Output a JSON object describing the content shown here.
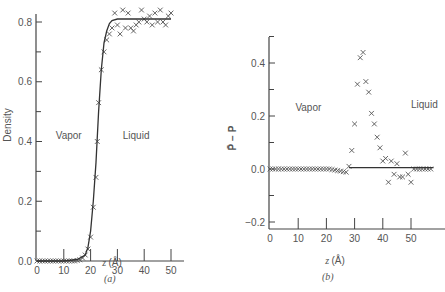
{
  "chart_data": [
    {
      "id": "a",
      "type": "scatter",
      "caption": "(a)",
      "title": "",
      "xlabel": "z (Å)",
      "ylabel": "Density",
      "xlim": [
        0,
        55
      ],
      "ylim": [
        0,
        0.84
      ],
      "xticks": [
        0,
        10,
        20,
        30,
        40,
        50
      ],
      "yticks": [
        0.0,
        0.2,
        0.4,
        0.6,
        0.8
      ],
      "ytick_labels": [
        "0.0",
        "0.2",
        "0.4",
        "0.6",
        "0.8"
      ],
      "grid": false,
      "annotations": [
        {
          "text": "Vapor",
          "x": 7,
          "y": 0.41
        },
        {
          "text": "Liquid",
          "x": 32,
          "y": 0.41
        }
      ],
      "series": [
        {
          "name": "simulation",
          "style": "markers-x",
          "x": [
            0,
            1,
            2,
            3,
            4,
            5,
            6,
            7,
            8,
            9,
            10,
            11,
            12,
            13,
            14,
            15,
            16,
            17,
            18,
            19,
            20,
            21,
            22,
            22.5,
            23,
            24,
            25,
            26,
            27,
            28,
            29,
            30,
            31,
            32,
            33,
            34,
            35,
            36,
            37,
            38,
            39,
            40,
            41,
            42,
            43,
            44,
            45,
            46,
            47,
            48,
            49,
            50
          ],
          "y": [
            0,
            0,
            0,
            0,
            0,
            0,
            0,
            0,
            0,
            0,
            0,
            0,
            0,
            0,
            0,
            0.002,
            0.004,
            0.01,
            0.02,
            0.04,
            0.08,
            0.18,
            0.28,
            0.4,
            0.53,
            0.64,
            0.7,
            0.74,
            0.76,
            0.78,
            0.83,
            0.79,
            0.76,
            0.84,
            0.78,
            0.83,
            0.78,
            0.77,
            0.79,
            0.8,
            0.84,
            0.81,
            0.8,
            0.82,
            0.79,
            0.83,
            0.8,
            0.84,
            0.8,
            0.79,
            0.82,
            0.83
          ]
        },
        {
          "name": "fit",
          "style": "line",
          "x": [
            0,
            5,
            10,
            15,
            18,
            19,
            20,
            21,
            22,
            23,
            24,
            25,
            26,
            27,
            28,
            30,
            35,
            40,
            45,
            50
          ],
          "y": [
            0,
            0,
            0,
            0.005,
            0.02,
            0.045,
            0.1,
            0.2,
            0.33,
            0.5,
            0.64,
            0.73,
            0.77,
            0.795,
            0.805,
            0.81,
            0.81,
            0.81,
            0.81,
            0.81
          ]
        }
      ]
    },
    {
      "id": "b",
      "type": "scatter",
      "caption": "(b)",
      "title": "",
      "xlabel": "z (Å)",
      "ylabel": "P̄ − P",
      "xlim": [
        0,
        58
      ],
      "ylim": [
        -0.22,
        0.5
      ],
      "xticks": [
        0,
        10,
        20,
        30,
        40,
        50
      ],
      "yticks": [
        -0.2,
        0.0,
        0.2,
        0.4
      ],
      "ytick_labels": [
        "−0.2",
        "0.0",
        "0.2",
        "0.4"
      ],
      "grid": false,
      "annotations": [
        {
          "text": "Vapor",
          "x": 9,
          "y": 0.22
        },
        {
          "text": "Liquid",
          "x": 50,
          "y": 0.23
        }
      ],
      "series": [
        {
          "name": "simulation",
          "style": "markers-x",
          "x": [
            0,
            1,
            2,
            3,
            4,
            5,
            6,
            7,
            8,
            9,
            10,
            11,
            12,
            13,
            14,
            15,
            16,
            17,
            18,
            19,
            20,
            21,
            22,
            23,
            24,
            25,
            26,
            27,
            28,
            29,
            30,
            31,
            32,
            33,
            34,
            35,
            36,
            37,
            38,
            39,
            40,
            41,
            42,
            43,
            44,
            45,
            46,
            47,
            48,
            49,
            50,
            51,
            52,
            53,
            54,
            55,
            56,
            57
          ],
          "y": [
            0,
            0,
            0,
            0,
            0,
            0,
            0,
            0,
            0,
            0,
            0,
            0,
            0,
            0,
            0,
            0,
            0,
            0,
            0,
            0,
            0,
            0,
            -0.002,
            -0.004,
            -0.006,
            -0.008,
            -0.01,
            -0.012,
            0.01,
            0.07,
            0.17,
            0.32,
            0.42,
            0.44,
            0.33,
            0.29,
            0.21,
            0.17,
            0.12,
            0.08,
            0.03,
            0.04,
            -0.05,
            0.03,
            -0.02,
            0.02,
            -0.03,
            -0.03,
            0.06,
            -0.02,
            -0.05,
            0.0,
            0.0,
            0.0,
            0.0,
            0.0,
            0.0,
            0.0
          ]
        },
        {
          "name": "reference",
          "style": "line",
          "x": [
            28,
            58
          ],
          "y": [
            0.005,
            0.005
          ]
        }
      ]
    }
  ]
}
